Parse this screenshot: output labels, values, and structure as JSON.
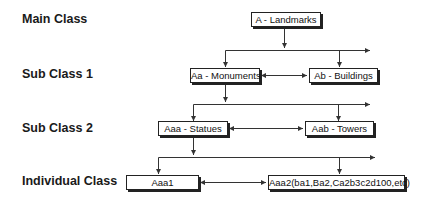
{
  "levels": [
    {
      "label": "Main Class"
    },
    {
      "label": "Sub Class 1"
    },
    {
      "label": "Sub Class 2"
    },
    {
      "label": "Individual Class"
    }
  ],
  "nodes": {
    "landmarks": "A - Landmarks",
    "monuments": "Aa - Monuments",
    "buildings": "Ab - Buildings",
    "statues": "Aaa - Statues",
    "towers": "Aab - Towers",
    "aaa1": "Aaa1",
    "aaa2": "Aaa2(ba1,Ba2,Ca2b3c2d100,etc)"
  },
  "colors": {
    "line": "#333333",
    "box_border": "#222222",
    "shadow": "#222222",
    "text": "#111111"
  }
}
